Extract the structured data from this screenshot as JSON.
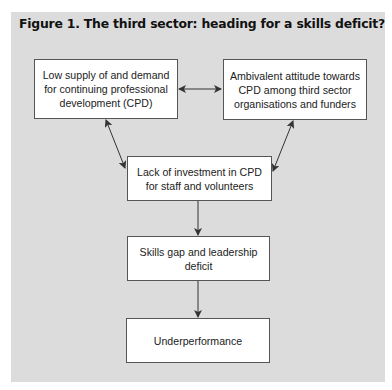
{
  "figure": {
    "title": "Figure 1. The third sector: heading for a skills deficit?"
  },
  "nodes": [
    {
      "id": "low-supply",
      "label": "Low supply of and demand for continuing professional development (CPD)"
    },
    {
      "id": "ambivalent-attitude",
      "label": "Ambivalent attitude towards CPD among third sector organisations and funders"
    },
    {
      "id": "lack-of-investment",
      "label": "Lack of investment in CPD for staff and volunteers"
    },
    {
      "id": "skills-gap",
      "label": "Skills gap and leadership deficit"
    },
    {
      "id": "underperformance",
      "label": "Underperformance"
    }
  ],
  "edges": [
    {
      "from": "low-supply",
      "to": "ambivalent-attitude",
      "type": "bidirectional"
    },
    {
      "from": "low-supply",
      "to": "lack-of-investment",
      "type": "bidirectional"
    },
    {
      "from": "ambivalent-attitude",
      "to": "lack-of-investment",
      "type": "bidirectional"
    },
    {
      "from": "lack-of-investment",
      "to": "skills-gap",
      "type": "directed"
    },
    {
      "from": "skills-gap",
      "to": "underperformance",
      "type": "directed"
    }
  ],
  "colors": {
    "panel_background": "#dcdcdc",
    "box_background": "#ffffff",
    "box_border": "#555555",
    "arrow": "#333333",
    "text": "#222222"
  }
}
